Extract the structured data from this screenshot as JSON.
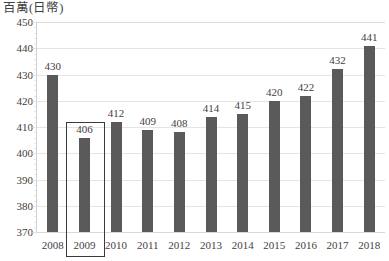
{
  "chart_data": {
    "type": "bar",
    "title": "百萬(日幣)",
    "xlabel": "",
    "ylabel": "百萬(日幣)",
    "ylim": [
      370,
      450
    ],
    "ytick_step": 10,
    "yticks": [
      450,
      440,
      430,
      420,
      410,
      400,
      390,
      380,
      370
    ],
    "grid": true,
    "legend": false,
    "legend_position": "none",
    "categories": [
      "2008",
      "2009",
      "2010",
      "2011",
      "2012",
      "2013",
      "2014",
      "2015",
      "2016",
      "2017",
      "2018"
    ],
    "values": [
      430,
      406,
      412,
      409,
      408,
      414,
      415,
      420,
      422,
      432,
      441
    ],
    "data_labels": [
      "430",
      "406",
      "412",
      "409",
      "408",
      "414",
      "415",
      "420",
      "422",
      "432",
      "441"
    ],
    "highlight": {
      "category": "2009",
      "value": 406,
      "style": "rectangle-outline"
    }
  },
  "colors": {
    "bar": "#5a5a5a",
    "gridline": "#e4e4e4",
    "axis": "#d2d2d2",
    "text": "#3f3f3f",
    "highlight_border": "#3a3a3a",
    "background": "#ffffff"
  }
}
